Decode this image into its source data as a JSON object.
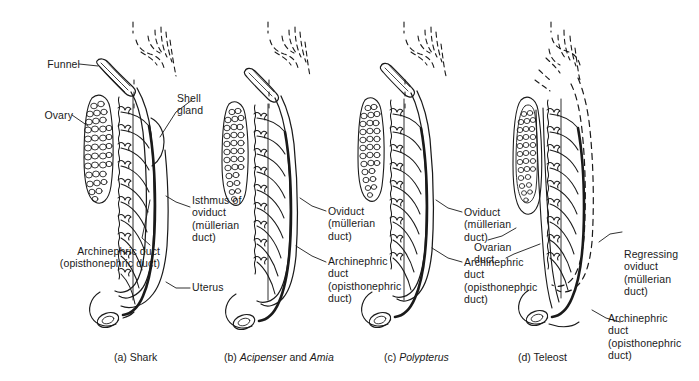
{
  "figure": {
    "width": 699,
    "height": 381,
    "background": "#ffffff",
    "ink": "#1a1a1a"
  },
  "panels": [
    {
      "id": "a",
      "letter": "(a)",
      "caption_plain": "Shark",
      "caption_sci": "",
      "caption_tail": "",
      "full_caption": "(a) Shark",
      "oviduct_state": "solid",
      "has_shell_gland": true,
      "has_uterus": true,
      "has_ovarian_duct": false
    },
    {
      "id": "b",
      "letter": "(b)",
      "caption_plain": "",
      "caption_sci": "Acipenser",
      "caption_tail": " and ",
      "caption_sci2": "Amia",
      "full_caption": "(b) Acipenser and Amia",
      "oviduct_state": "solid",
      "has_shell_gland": false,
      "has_uterus": false,
      "has_ovarian_duct": false
    },
    {
      "id": "c",
      "letter": "(c)",
      "caption_plain": "",
      "caption_sci": "Polypterus",
      "caption_tail": "",
      "full_caption": "(c) Polypterus",
      "oviduct_state": "solid",
      "has_shell_gland": false,
      "has_uterus": false,
      "has_ovarian_duct": false
    },
    {
      "id": "d",
      "letter": "(d)",
      "caption_plain": "Teleost",
      "caption_sci": "",
      "caption_tail": "",
      "full_caption": "(d) Teleost",
      "oviduct_state": "dashed-regressing",
      "has_shell_gland": false,
      "has_uterus": false,
      "has_ovarian_duct": true
    }
  ],
  "labels": {
    "funnel": "Funnel",
    "ovary": "Ovary",
    "shell_gland": "Shell\ngland",
    "isthmus_of_oviduct": "Isthmus of\noviduct\n(müllerian\nduct)",
    "uterus": "Uterus",
    "archinephric_duct_a": "Archinephric duct\n(opisthonephric duct)",
    "oviduct_b": "Oviduct\n(müllerian\nduct)",
    "archinephric_duct_b": "Archinephric\nduct\n(opisthonephric\nduct)",
    "oviduct_c": "Oviduct\n(müllerian\nduct)",
    "archinephric_duct_c": "Archinephric\nduct\n(opisthonephric\nduct)",
    "ovarian_duct_d": "Ovarian\nduct",
    "regressing_oviduct_d": "Regressing\noviduct\n(müllerian\nduct)",
    "archinephric_duct_d": "Archinephric\nduct\n(opisthonephric\nduct)"
  },
  "captions": {
    "a": "(a) Shark",
    "b_letter": "(b)",
    "b_sci1": "Acipenser",
    "b_and": "and",
    "b_sci2": "Amia",
    "c_letter": "(c)",
    "c_sci": "Polypterus",
    "d": "(d) Teleost"
  }
}
